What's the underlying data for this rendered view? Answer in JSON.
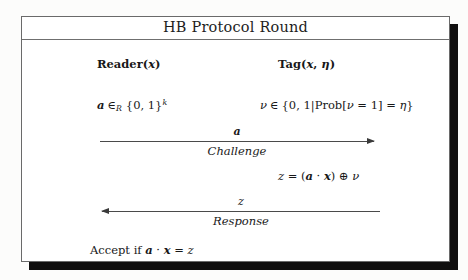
{
  "figure": {
    "title": "HB Protocol Round",
    "participants": {
      "reader": {
        "name": "Reader",
        "open_paren": "(",
        "arg": "x",
        "close_paren": ")"
      },
      "tag": {
        "name": "Tag",
        "open_paren": "(",
        "arg1": "x",
        "comma": ", ",
        "arg2": "η",
        "close_paren": ")"
      }
    },
    "reader_expression": {
      "variable": "a",
      "relation": "∈",
      "relation_subscript": "R",
      "set_open": "{0, 1}",
      "exponent": "k"
    },
    "tag_expression": {
      "variable": "ν",
      "relation": "∈",
      "set_open": "{",
      "set_body_zero_one": "0, 1",
      "separator": "|",
      "prob_name": "Prob",
      "prob_open": "[",
      "prob_var": "ν",
      "prob_equals": " = ",
      "prob_value": "1",
      "prob_close": "]",
      "equals": " = ",
      "eta": "η",
      "set_close": "}"
    },
    "tag_computation": {
      "lhs": "z",
      "equals": " = ",
      "open_paren": "(",
      "vector_a": "a",
      "dot": " · ",
      "vector_x": "x",
      "close_paren": ")",
      "xor": " ⊕ ",
      "noise": "ν"
    },
    "messages": [
      {
        "id": "challenge",
        "symbol": "a",
        "caption": "Challenge",
        "direction": "right",
        "from": "Reader",
        "to": "Tag"
      },
      {
        "id": "response",
        "symbol": "z",
        "caption": "Response",
        "direction": "left",
        "from": "Tag",
        "to": "Reader"
      }
    ],
    "accept_condition": {
      "prefix": "Accept if ",
      "vector_a": "a",
      "dot": " · ",
      "vector_x": "x",
      "equals": " = ",
      "rhs": "z"
    },
    "colors": {
      "ink": "#181818",
      "rule": "#6f6f6f",
      "frame_border": "#6a6a6a",
      "shadow": "#100f0f",
      "paper": "#ffffff",
      "page_background": "#fcfcfb"
    }
  }
}
